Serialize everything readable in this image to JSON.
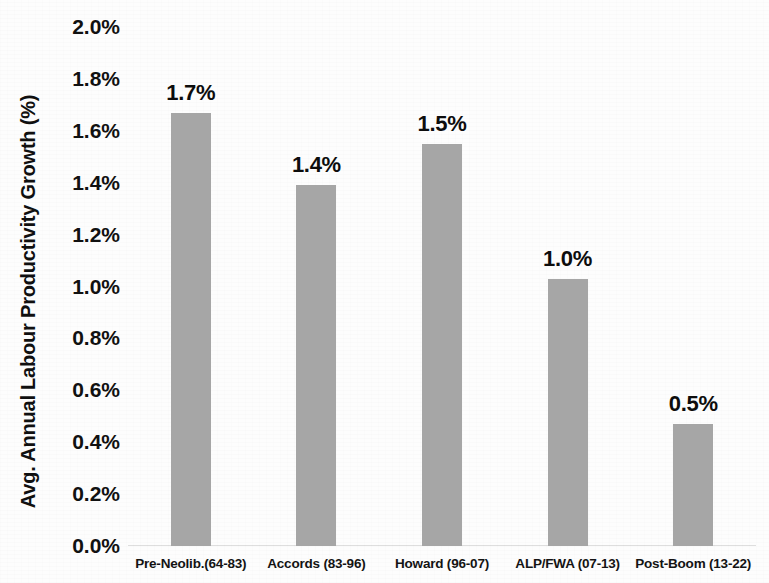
{
  "chart_data": {
    "type": "bar",
    "title": "",
    "xlabel": "",
    "ylabel": "Avg. Annual Labour Productivity Growth (%)",
    "categories": [
      "Pre-Neolib.(64-83)",
      "Accords (83-96)",
      "Howard (96-07)",
      "ALP/FWA (07-13)",
      "Post-Boom (13-22)"
    ],
    "values": [
      1.67,
      1.39,
      1.55,
      1.03,
      0.47
    ],
    "data_labels": [
      "1.7%",
      "1.4%",
      "1.5%",
      "1.0%",
      "0.5%"
    ],
    "ylim": [
      0.0,
      2.0
    ],
    "ytick_values": [
      0.0,
      0.2,
      0.4,
      0.6,
      0.8,
      1.0,
      1.2,
      1.4,
      1.6,
      1.8,
      2.0
    ],
    "ytick_labels": [
      "2.0%",
      "1.8%",
      "1.6%",
      "1.4%",
      "1.2%",
      "1.0%",
      "0.8%",
      "0.6%",
      "0.4%",
      "0.2%",
      "0.0%"
    ],
    "grid": false,
    "legend": false,
    "bar_color": "#a6a6a6",
    "background_color": "#ffffff",
    "text_color": "#111111"
  }
}
